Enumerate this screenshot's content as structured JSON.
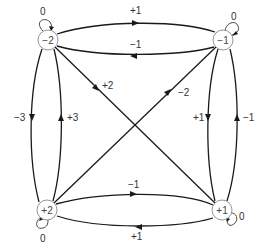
{
  "nodes": [
    {
      "id": "nm2",
      "label": "−2"
    },
    {
      "id": "nm1",
      "label": "−1"
    },
    {
      "id": "np2",
      "label": "+2"
    },
    {
      "id": "np1",
      "label": "+1"
    }
  ],
  "self_loops": {
    "nm2": "0",
    "nm1": "0",
    "np2": "0",
    "np1": "0"
  },
  "edges": {
    "nm2_to_nm1": "+1",
    "nm1_to_nm2": "−1",
    "nm2_to_np2": "−3",
    "np2_to_nm2": "+3",
    "nm2_to_np1": "+2",
    "np2_to_nm1": "−2",
    "nm1_to_np1": "+1",
    "np1_to_nm1": "−1",
    "np2_to_np1": "−1",
    "np1_to_np2": "+1"
  }
}
